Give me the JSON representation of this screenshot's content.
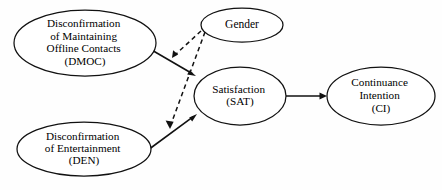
{
  "diagram": {
    "type": "path-model",
    "background_color": "#fefefe",
    "line_color": "#111111",
    "node_fill": "#ffffff",
    "nodes": [
      {
        "id": "dmoc",
        "name": "disconfirmation-of-maintaining-offline-contacts",
        "shape": "ellipse",
        "cx": 85,
        "cy": 43,
        "rx": 71,
        "ry": 33,
        "font_size": 11.2,
        "line_height": 12.4,
        "lines": [
          "Disconfirmation",
          "of Maintaining",
          "Offline Contacts",
          "(DMOC)"
        ]
      },
      {
        "id": "den",
        "name": "disconfirmation-of-entertainment",
        "shape": "ellipse",
        "cx": 84,
        "cy": 149,
        "rx": 67,
        "ry": 27,
        "font_size": 11.2,
        "line_height": 12.4,
        "lines": [
          "Disconfirmation",
          "of Entertainment",
          "(DEN)"
        ]
      },
      {
        "id": "gender",
        "name": "gender",
        "shape": "ellipse",
        "cx": 242,
        "cy": 25,
        "rx": 41,
        "ry": 17,
        "font_size": 11.5,
        "line_height": 12.4,
        "lines": [
          "Gender"
        ]
      },
      {
        "id": "sat",
        "name": "satisfaction",
        "shape": "ellipse",
        "cx": 240,
        "cy": 96,
        "rx": 46,
        "ry": 29,
        "font_size": 11.2,
        "line_height": 12.8,
        "lines": [
          "Satisfaction",
          "(SAT)"
        ]
      },
      {
        "id": "ci",
        "name": "continuance-intention",
        "shape": "ellipse",
        "cx": 381,
        "cy": 96,
        "rx": 54,
        "ry": 29,
        "font_size": 11.2,
        "line_height": 12.8,
        "lines": [
          "Continuance",
          "Intention",
          "(CI)"
        ]
      }
    ],
    "edges": [
      {
        "id": "dmoc-to-sat",
        "name": "edge-dmoc-to-satisfaction",
        "style": "solid",
        "from": "dmoc",
        "to": "sat",
        "x1": 150,
        "y1": 49,
        "x2": 196,
        "y2": 76
      },
      {
        "id": "den-to-sat",
        "name": "edge-den-to-satisfaction",
        "style": "solid",
        "from": "den",
        "to": "sat",
        "x1": 148,
        "y1": 150,
        "x2": 197,
        "y2": 114
      },
      {
        "id": "sat-to-ci",
        "name": "edge-satisfaction-to-continuance-intention",
        "style": "solid",
        "from": "sat",
        "to": "ci",
        "x1": 286,
        "y1": 96,
        "x2": 327,
        "y2": 96
      },
      {
        "id": "gender-moderates-dmoc-sat",
        "name": "edge-gender-moderates-dmoc-to-satisfaction",
        "style": "dashed",
        "from": "gender",
        "to": "dmoc-to-sat",
        "x1": 201,
        "y1": 31,
        "x2": 173,
        "y2": 59
      },
      {
        "id": "gender-moderates-den-sat",
        "name": "edge-gender-moderates-den-to-satisfaction",
        "style": "dashed",
        "from": "gender",
        "to": "den-to-sat",
        "x1": 205,
        "y1": 32,
        "x2": 170,
        "y2": 129
      }
    ]
  }
}
